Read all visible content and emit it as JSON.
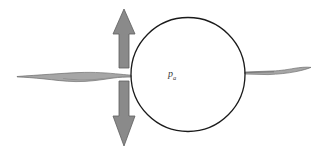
{
  "figure": {
    "background_color": "#ffffff",
    "width": 323,
    "height": 153,
    "labels": {
      "pressure_symbol": "p",
      "pressure_subscript": "a",
      "pressure_full": "pa",
      "pressure_color": "#3a3a3a",
      "pressure_x": 168,
      "pressure_y": 69
    },
    "circle": {
      "name": "bubble-outline",
      "center_x": 188,
      "center_y": 74.5,
      "radius": 57,
      "stroke_color": "#1a1a1a",
      "stroke_width": 1.3,
      "fill": "none"
    },
    "arrow": {
      "name": "vertical-double-arrow",
      "fill_color": "#8a8a8a",
      "stroke_color": "#5e5e5e",
      "stroke_width": 0.8,
      "center_x": 124,
      "shaft_half_width": 5,
      "head_half_width": 11,
      "top_tip_y": 9,
      "top_head_base_y": 33,
      "top_shaft_bottom_y": 68,
      "bottom_shaft_top_y": 81,
      "bottom_head_base_y": 116,
      "bottom_tip_y": 146
    },
    "membrane_left": {
      "name": "membrane-left-ribbon",
      "fill_color": "#a6a6a6",
      "stroke_color": "#6e6e6e",
      "stroke_width": 0.7,
      "start_x": 17,
      "end_x": 131,
      "baseline_y": 75
    },
    "membrane_right": {
      "name": "membrane-right-ribbon",
      "fill_color": "#a6a6a6",
      "stroke_color": "#6e6e6e",
      "stroke_width": 0.7,
      "start_x": 245,
      "end_x": 311,
      "baseline_y": 72
    }
  }
}
